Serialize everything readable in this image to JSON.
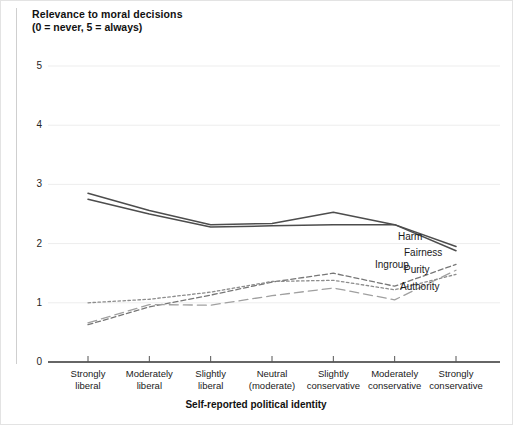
{
  "chart_data": {
    "type": "line",
    "title": "Relevance to moral decisions",
    "subtitle": "(0 = never, 5 = always)",
    "xlabel": "Self-reported political identity",
    "ylabel": "Relevance to moral decisions",
    "ylim": [
      0,
      5
    ],
    "yticks": [
      0,
      1,
      2,
      3,
      4,
      5
    ],
    "ytick_labels": [
      "0",
      "1",
      "2",
      "3",
      "4",
      "5"
    ],
    "grid": "horizontal",
    "legend_position": "right-inline",
    "categories": [
      "Strongly\nliberal",
      "Moderately\nliberal",
      "Slightly\nliberal",
      "Neutral\n(moderate)",
      "Slightly\nconservative",
      "Moderately\nconservative",
      "Strongly\nconservative"
    ],
    "series": [
      {
        "name": "Harm",
        "style": "solid",
        "color": "#4d4d4d",
        "values": [
          2.85,
          2.56,
          2.32,
          2.34,
          2.53,
          2.32,
          1.95
        ]
      },
      {
        "name": "Fairness",
        "style": "solid",
        "color": "#4d4d4d",
        "values": [
          2.75,
          2.5,
          2.28,
          2.3,
          2.32,
          2.32,
          1.88
        ]
      },
      {
        "name": "Ingroup",
        "style": "dashed",
        "color": "#777777",
        "values": [
          0.63,
          0.93,
          1.13,
          1.35,
          1.5,
          1.28,
          1.65
        ]
      },
      {
        "name": "Purity",
        "style": "dashed-long",
        "color": "#a0a0a0",
        "values": [
          0.66,
          0.97,
          0.96,
          1.12,
          1.25,
          1.05,
          1.55
        ]
      },
      {
        "name": "Authority",
        "style": "dotted",
        "color": "#8c8c8c",
        "values": [
          1.0,
          1.06,
          1.18,
          1.36,
          1.38,
          1.22,
          1.48
        ]
      }
    ],
    "annotations": [
      {
        "text": "Harm",
        "x": 398,
        "y": 231
      },
      {
        "text": "Fairness",
        "x": 404,
        "y": 247
      },
      {
        "text": "Ingroup",
        "x": 375,
        "y": 259
      },
      {
        "text": "Purity",
        "x": 404,
        "y": 264
      },
      {
        "text": "Authority",
        "x": 400,
        "y": 281
      }
    ]
  },
  "colors": {
    "axis": "#333333",
    "grid": "#ededed",
    "text": "#1a1a1a",
    "frame": "#e3e3e3"
  }
}
